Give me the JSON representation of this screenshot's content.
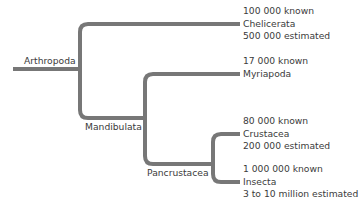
{
  "diagram": {
    "type": "phylogenetic-tree",
    "line_color": "#777777",
    "root": {
      "label": "Arthropoda"
    },
    "internal_nodes": [
      {
        "label": "Mandibulata"
      },
      {
        "label": "Pancrustacea"
      }
    ],
    "leaves": [
      {
        "name": "Chelicerata",
        "known": "100 000 known",
        "estimated": "500 000 estimated"
      },
      {
        "name": "Myriapoda",
        "known": "17 000 known",
        "estimated": null
      },
      {
        "name": "Crustacea",
        "known": "80 000 known",
        "estimated": "200 000 estimated"
      },
      {
        "name": "Insecta",
        "known": "1 000 000 known",
        "estimated": "3 to 10 million estimated"
      }
    ]
  }
}
